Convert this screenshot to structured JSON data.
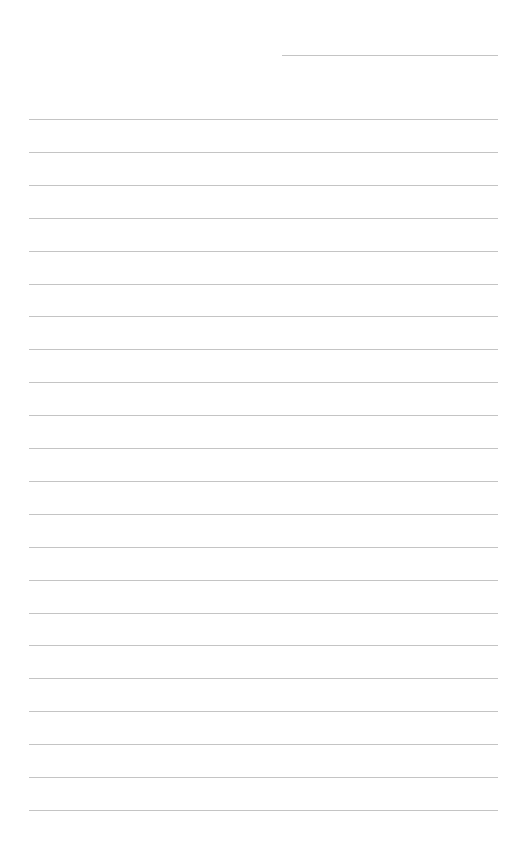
{
  "page": {
    "type": "lined-paper",
    "background_color": "#ffffff",
    "line_color": "#c4c4c4"
  },
  "header_line": {
    "left": 282,
    "right": 498,
    "top": 55
  },
  "ruled_lines": {
    "left": 29,
    "right": 498,
    "first_top": 119,
    "spacing": 32.9,
    "count": 22
  }
}
